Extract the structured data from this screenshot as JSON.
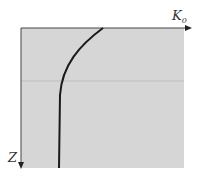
{
  "diagram": {
    "x_axis_label": "K",
    "x_axis_subscript": "0",
    "y_axis_label": "Z",
    "colors": {
      "background": "#ffffff",
      "fill": "#d6d6d6",
      "axis": "#444444",
      "curve": "#1a1a1a",
      "divider": "#bdbdbd"
    }
  }
}
